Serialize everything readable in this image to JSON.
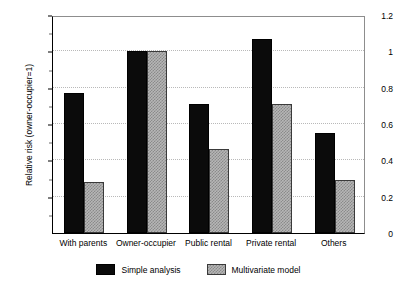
{
  "chart_data": {
    "type": "bar",
    "title": "",
    "subtitle": "",
    "xlabel": "",
    "ylabel": "Relative risk (owner-occupier=1)",
    "categories": [
      "With parents",
      "Owner-occupier",
      "Public rental",
      "Private rental",
      "Others"
    ],
    "series": [
      {
        "name": "Simple analysis",
        "color": "#0b0b0b",
        "fill": "solid-black",
        "values": [
          0.77,
          1.0,
          0.71,
          1.07,
          0.55
        ]
      },
      {
        "name": "Multivariate model",
        "color": "#b6b6b6",
        "fill": "checkered-gray",
        "values": [
          0.28,
          1.0,
          0.46,
          0.71,
          0.29
        ]
      }
    ],
    "ylim": [
      0,
      1.2
    ],
    "yticks": [
      0,
      0.2,
      0.4,
      0.6,
      0.8,
      1,
      1.2
    ],
    "ytick_labels": [
      "0",
      "0.2",
      "0.4",
      "0.6",
      "0.8",
      "1",
      "1.2"
    ],
    "yminor_ticks": [
      0.1,
      0.3,
      0.5,
      0.7,
      0.9,
      1.1
    ],
    "grid": "horizontal-dotted",
    "legend_position": "bottom-center",
    "legend": [
      "Simple analysis",
      "Multivariate model"
    ],
    "annotations": []
  },
  "axes": {
    "y_axis_title": "Relative risk (owner-occupier=1)"
  },
  "legend": {
    "items": [
      {
        "label": "Simple analysis"
      },
      {
        "label": "Multivariate model"
      }
    ]
  }
}
